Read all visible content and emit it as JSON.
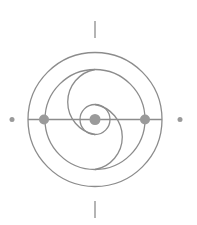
{
  "diagram": {
    "title": "Concentric circles with spiral arcs symbol",
    "colors": {
      "stroke": "#8c8c8c",
      "dot": "#9a9a9a",
      "background": "#ffffff"
    },
    "center": {
      "x": 95,
      "y": 119.5
    },
    "outer_circle_radius": 67,
    "inner_circle_radius": 50,
    "core_ring_radius": 15,
    "spiral_arc_radius": 33,
    "dots": [
      {
        "name": "left-node",
        "x": 44,
        "y": 119.5,
        "r": 5
      },
      {
        "name": "center-node",
        "x": 95,
        "y": 119.5,
        "r": 5.5
      },
      {
        "name": "right-node",
        "x": 145,
        "y": 119.5,
        "r": 5
      }
    ],
    "outer_markers": [
      {
        "name": "left-marker",
        "x": 12,
        "y": 119.5,
        "r": 2.5
      },
      {
        "name": "right-marker",
        "x": 180,
        "y": 119.5,
        "r": 2.5
      }
    ],
    "ticks": [
      {
        "name": "top-tick",
        "x": 95,
        "y1": 21,
        "y2": 38
      },
      {
        "name": "bottom-tick",
        "x": 95,
        "y1": 201,
        "y2": 218
      }
    ]
  }
}
